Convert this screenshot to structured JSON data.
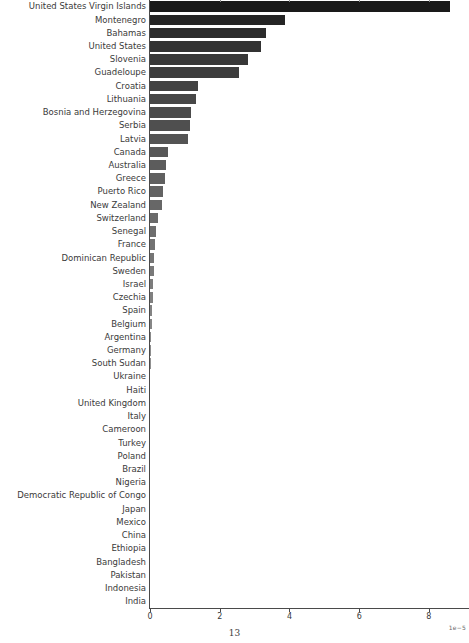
{
  "page": {
    "page_number": "13"
  },
  "chart_data": {
    "type": "bar",
    "orientation": "horizontal",
    "title": "",
    "xlabel": "",
    "ylabel": "",
    "grid": false,
    "legend": null,
    "x_axis_scale_label": "1e−5",
    "value_unit_multiplier": "1e-5",
    "xlim": [
      0,
      9.15
    ],
    "x_tick_values": [
      0,
      2,
      4,
      6,
      8
    ],
    "x_tick_labels": [
      "0",
      "2",
      "4",
      "6",
      "8"
    ],
    "top_remnant_tick_values": [
      2,
      4,
      6,
      8
    ],
    "bar_color_darkest": "#1a1a1a",
    "bar_color_lightest": "#c4c4c4",
    "categories": [
      "United States Virgin Islands",
      "Montenegro",
      "Bahamas",
      "United States",
      "Slovenia",
      "Guadeloupe",
      "Croatia",
      "Lithuania",
      "Bosnia and Herzegovina",
      "Serbia",
      "Latvia",
      "Canada",
      "Australia",
      "Greece",
      "Puerto Rico",
      "New Zealand",
      "Switzerland",
      "Senegal",
      "France",
      "Dominican Republic",
      "Sweden",
      "Israel",
      "Czechia",
      "Spain",
      "Belgium",
      "Argentina",
      "Germany",
      "South Sudan",
      "Ukraine",
      "Haiti",
      "United Kingdom",
      "Italy",
      "Cameroon",
      "Turkey",
      "Poland",
      "Brazil",
      "Nigeria",
      "Democratic Republic of Congo",
      "Japan",
      "Mexico",
      "China",
      "Ethiopia",
      "Bangladesh",
      "Pakistan",
      "Indonesia",
      "India"
    ],
    "values": [
      8.63,
      3.9,
      3.35,
      3.21,
      2.84,
      2.58,
      1.4,
      1.34,
      1.2,
      1.17,
      1.12,
      0.55,
      0.49,
      0.47,
      0.39,
      0.37,
      0.27,
      0.2,
      0.18,
      0.14,
      0.13,
      0.12,
      0.11,
      0.09,
      0.08,
      0.07,
      0.06,
      0.05,
      0.04,
      0.035,
      0.03,
      0.025,
      0.02,
      0.017,
      0.014,
      0.012,
      0.01,
      0.008,
      0.007,
      0.006,
      0.005,
      0.004,
      0.003,
      0.003,
      0.002,
      0.002
    ]
  }
}
